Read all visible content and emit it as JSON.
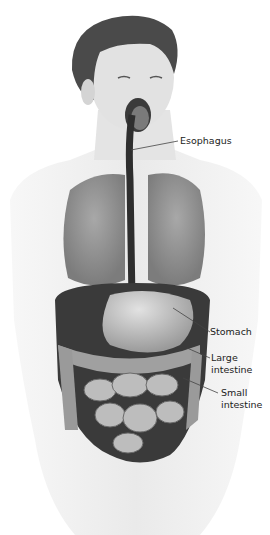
{
  "diagram": {
    "labels": [
      {
        "id": "esophagus",
        "text": "Esophagus"
      },
      {
        "id": "stomach",
        "text": "Stomach"
      },
      {
        "id": "large_intestine_1",
        "text": "Large"
      },
      {
        "id": "large_intestine_2",
        "text": "intestine"
      },
      {
        "id": "small_intestine_1",
        "text": "Small"
      },
      {
        "id": "small_intestine_2",
        "text": "intestine"
      }
    ],
    "colors": {
      "skin": "#eeeeee",
      "organ_dark": "#3a3a3a",
      "organ_mid": "#8a8a8a",
      "organ_light": "#c8c8c8",
      "hair": "#4a4a4a",
      "leader_line": "#444444"
    }
  }
}
